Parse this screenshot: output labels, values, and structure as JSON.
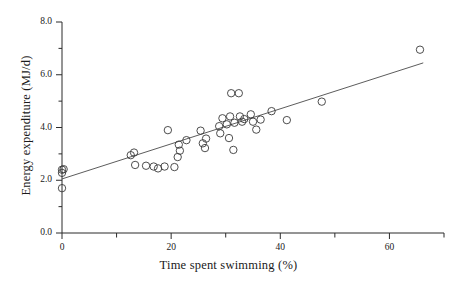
{
  "chart_data": {
    "type": "scatter",
    "title": "",
    "xlabel": "Time spent swimming (%)",
    "ylabel": "Energy expenditure (MJ/d)",
    "xlim": [
      0,
      70
    ],
    "ylim": [
      0.0,
      8.0
    ],
    "grid": false,
    "legend": null,
    "x_major_ticks": [
      0,
      20,
      40,
      60
    ],
    "x_major_tick_labels": [
      "0",
      "20",
      "40",
      "60"
    ],
    "x_minor_ticks": [
      10,
      30,
      50,
      70
    ],
    "y_major_ticks": [
      0.0,
      2.0,
      4.0,
      6.0,
      8.0
    ],
    "y_major_tick_labels": [
      "0.0",
      "2.0",
      "4.0",
      "6.0",
      "8.0"
    ],
    "y_minor_ticks": [
      1.0,
      3.0,
      5.0,
      7.0
    ],
    "marker": "open-circle",
    "marker_color": "#3a3a3a",
    "marker_size": 4.6,
    "line_color": "#4a4a4a",
    "points": [
      {
        "x": 0.0,
        "y": 1.7
      },
      {
        "x": 0.0,
        "y": 2.28
      },
      {
        "x": 0.3,
        "y": 2.42
      },
      {
        "x": 0.0,
        "y": 2.4
      },
      {
        "x": 12.6,
        "y": 2.95
      },
      {
        "x": 13.2,
        "y": 3.05
      },
      {
        "x": 13.4,
        "y": 2.58
      },
      {
        "x": 15.4,
        "y": 2.55
      },
      {
        "x": 16.8,
        "y": 2.52
      },
      {
        "x": 17.6,
        "y": 2.45
      },
      {
        "x": 18.8,
        "y": 2.52
      },
      {
        "x": 19.4,
        "y": 3.9
      },
      {
        "x": 20.6,
        "y": 2.5
      },
      {
        "x": 21.2,
        "y": 2.88
      },
      {
        "x": 21.4,
        "y": 3.35
      },
      {
        "x": 21.6,
        "y": 3.12
      },
      {
        "x": 22.8,
        "y": 3.52
      },
      {
        "x": 25.4,
        "y": 3.88
      },
      {
        "x": 25.8,
        "y": 3.4
      },
      {
        "x": 26.4,
        "y": 3.58
      },
      {
        "x": 26.2,
        "y": 3.22
      },
      {
        "x": 28.8,
        "y": 4.05
      },
      {
        "x": 29.0,
        "y": 3.78
      },
      {
        "x": 29.4,
        "y": 4.35
      },
      {
        "x": 30.2,
        "y": 4.12
      },
      {
        "x": 30.6,
        "y": 3.6
      },
      {
        "x": 30.8,
        "y": 4.42
      },
      {
        "x": 31.0,
        "y": 5.3
      },
      {
        "x": 32.4,
        "y": 5.3
      },
      {
        "x": 31.6,
        "y": 4.18
      },
      {
        "x": 31.4,
        "y": 3.15
      },
      {
        "x": 32.6,
        "y": 4.42
      },
      {
        "x": 33.0,
        "y": 4.22
      },
      {
        "x": 33.4,
        "y": 4.32
      },
      {
        "x": 34.6,
        "y": 4.5
      },
      {
        "x": 35.0,
        "y": 4.22
      },
      {
        "x": 35.6,
        "y": 3.92
      },
      {
        "x": 36.4,
        "y": 4.3
      },
      {
        "x": 38.4,
        "y": 4.62
      },
      {
        "x": 41.2,
        "y": 4.28
      },
      {
        "x": 47.6,
        "y": 4.98
      },
      {
        "x": 65.6,
        "y": 6.95
      }
    ],
    "fit_line": {
      "x_start": 0.0,
      "y_start": 2.05,
      "x_end": 66.2,
      "y_end": 6.45
    }
  }
}
